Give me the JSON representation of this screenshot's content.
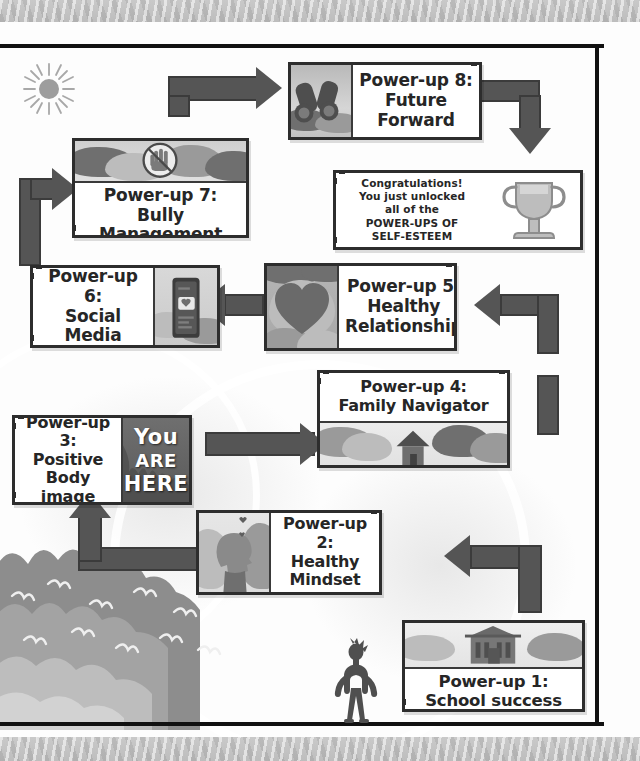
{
  "meta": {
    "marker_text_lines": [
      "You",
      "ARE",
      "HERE"
    ],
    "colors": {
      "box_border": "#2d2d2d",
      "box_fill": "#ffffff",
      "arrow": "#555555",
      "arrow_border": "#3b3b3b",
      "banner": "#c4c4c4",
      "frame_rule": "#111111",
      "text": "#262626"
    }
  },
  "nodes": [
    {
      "id": "powerup8",
      "label": "Power-up 8:\nFuture\nForward",
      "icon": "binoculars-icon",
      "layout": "image-left"
    },
    {
      "id": "congratulations",
      "label": "Congratulations!\nYou just unlocked\nall of the\nPOWER-UPS OF\nSELF-ESTEEM",
      "icon": "trophy-icon",
      "layout": "text-left"
    },
    {
      "id": "powerup7",
      "label": "Power-up 7:\nBully\nManagement",
      "icon": "no-hand-icon",
      "layout": "image-top"
    },
    {
      "id": "powerup6",
      "label": "Power-up 6:\nSocial\nMedia",
      "icon": "smartphone-icon",
      "layout": "text-left"
    },
    {
      "id": "powerup5",
      "label": "Power-up 5:\nHealthy\nRelationship",
      "icon": "heart-icon",
      "layout": "image-left"
    },
    {
      "id": "powerup4",
      "label": "Power-up 4:\nFamily Navigator",
      "icon": "house-icon",
      "layout": "text-top"
    },
    {
      "id": "powerup3",
      "label": "Power-up 3:\nPositive\nBody image",
      "icon": "you-are-here-marker",
      "layout": "text-left"
    },
    {
      "id": "powerup2",
      "label": "Power-up 2:\nHealthy\nMindset",
      "icon": "head-profile-hearts-icon",
      "layout": "image-left"
    },
    {
      "id": "powerup1",
      "label": "Power-up 1:\nSchool success",
      "icon": "school-building-icon",
      "layout": "image-top"
    }
  ],
  "decorations": {
    "sun": "sun-icon",
    "avatar": "standing-person-silhouette"
  }
}
